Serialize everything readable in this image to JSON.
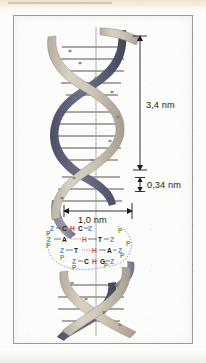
{
  "figure": {
    "helix": {
      "front_strand_color": "#c9c2b4",
      "back_strand_color": "#5d6076",
      "rung_color": "#8b8b8b",
      "turns": 4
    },
    "axis_line_label": "helix-axis"
  },
  "dimensions": [
    {
      "id": "pitch",
      "label": "3,4 nm",
      "meaning": "full helical turn pitch",
      "orientation": "vertical"
    },
    {
      "id": "rise",
      "label": "0,34 nm",
      "meaning": "rise per base pair",
      "orientation": "vertical"
    },
    {
      "id": "diameter",
      "label": "1,0 nm",
      "meaning": "helix diameter",
      "orientation": "horizontal"
    }
  ],
  "base_pair_detail": {
    "rows": [
      {
        "id": "row-1",
        "left_sugar": "Z",
        "left_base": "C",
        "hbond": "H",
        "right_base": "C",
        "right_sugar": "Z"
      },
      {
        "id": "row-2",
        "left_sugar": "Z",
        "left_base": "A",
        "hbond": "H",
        "right_base": "T",
        "right_sugar": "Z"
      },
      {
        "id": "row-3",
        "left_sugar": "Z",
        "left_base": "T",
        "hbond": "H",
        "right_base": "A",
        "right_sugar": "Z"
      },
      {
        "id": "row-4",
        "left_sugar": "Z",
        "left_base": "C",
        "hbond": "H",
        "right_base": "G",
        "right_sugar": "Z"
      }
    ],
    "phosphate_label": "P",
    "legend_colors": {
      "sugar": "#4a8fd4",
      "phosphate": "#7f9b3e",
      "base": "#141414",
      "hydrogen_bond": "#cf4b52"
    }
  }
}
